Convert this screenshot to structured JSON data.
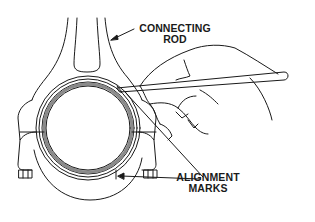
{
  "diagram": {
    "labels": {
      "connecting_rod": [
        "CONNECTING",
        "ROD"
      ],
      "alignment_marks": [
        "ALIGNMENT",
        "MARKS"
      ]
    },
    "elements": [
      "connecting-rod-beam",
      "big-end-housing",
      "bearing-shell",
      "rod-cap",
      "cap-bolts",
      "hand",
      "scribe-tool",
      "leader-lines"
    ],
    "colors": {
      "line": "#1a1a1a",
      "bearing": "#8a8a8a",
      "background": "#ffffff"
    }
  }
}
